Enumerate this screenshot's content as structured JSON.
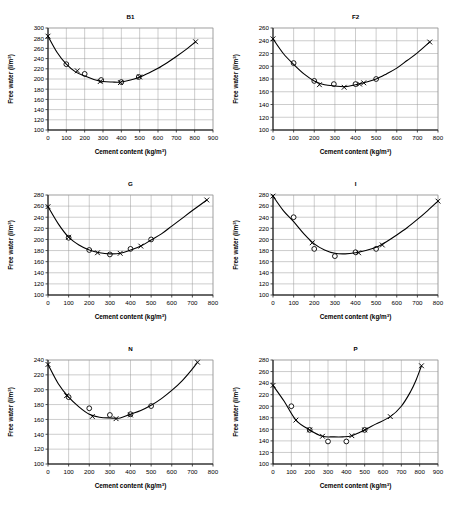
{
  "figure": {
    "background_color": "#ffffff",
    "line_color": "#000000",
    "grid_color": "#9a9a9a",
    "axis_label_x": "Cement content (kg/m",
    "axis_label_x_sup": "3",
    "axis_label_x_tail": ")",
    "axis_label_y": "Free water (l/m",
    "axis_label_y_sup": "3",
    "axis_label_y_tail": ")",
    "marker_legend": [
      "circle",
      "cross"
    ]
  },
  "chart_data": [
    {
      "type": "line",
      "title": "B1",
      "xlabel": "Cement content (kg/m3)",
      "ylabel": "Free water (l/m3)",
      "xlim": [
        0,
        900
      ],
      "ylim": [
        100,
        300
      ],
      "xticks": [
        0,
        100,
        200,
        300,
        400,
        500,
        600,
        700,
        800,
        900
      ],
      "yticks": [
        100,
        120,
        140,
        160,
        180,
        200,
        220,
        240,
        260,
        280,
        300
      ],
      "grid": true,
      "legend": "none",
      "series": [
        {
          "name": "measured-circle",
          "marker": "circle",
          "points": [
            [
              100,
              229
            ],
            [
              200,
              210
            ],
            [
              290,
              198
            ],
            [
              400,
              194
            ],
            [
              495,
              204
            ]
          ]
        },
        {
          "name": "predicted-cross",
          "marker": "cross",
          "points": [
            [
              0,
              284
            ],
            [
              160,
              216
            ],
            [
              285,
              195
            ],
            [
              395,
              193
            ],
            [
              500,
              204
            ],
            [
              805,
              273
            ]
          ]
        },
        {
          "name": "fitted-curve",
          "marker": "none",
          "points": [
            [
              0,
              284
            ],
            [
              50,
              252
            ],
            [
              100,
              229
            ],
            [
              150,
              214
            ],
            [
              200,
              206
            ],
            [
              250,
              199
            ],
            [
              300,
              195
            ],
            [
              350,
              194
            ],
            [
              400,
              194
            ],
            [
              450,
              198
            ],
            [
              500,
              204
            ],
            [
              550,
              212
            ],
            [
              600,
              221
            ],
            [
              650,
              232
            ],
            [
              700,
              244
            ],
            [
              750,
              257
            ],
            [
              805,
              273
            ]
          ]
        }
      ]
    },
    {
      "type": "line",
      "title": "F2",
      "xlabel": "Cement content (kg/m3)",
      "ylabel": "Free water (l/m3)",
      "xlim": [
        0,
        800
      ],
      "ylim": [
        100,
        260
      ],
      "xticks": [
        0,
        100,
        200,
        300,
        400,
        500,
        600,
        700,
        800
      ],
      "yticks": [
        100,
        120,
        140,
        160,
        180,
        200,
        220,
        240,
        260
      ],
      "grid": true,
      "legend": "none",
      "series": [
        {
          "name": "measured-circle",
          "marker": "circle",
          "points": [
            [
              100,
              205
            ],
            [
              200,
              177
            ],
            [
              295,
              172
            ],
            [
              400,
              172
            ],
            [
              500,
              180
            ]
          ]
        },
        {
          "name": "predicted-cross",
          "marker": "cross",
          "points": [
            [
              0,
              243
            ],
            [
              225,
              171
            ],
            [
              345,
              167
            ],
            [
              420,
              172
            ],
            [
              440,
              174
            ],
            [
              760,
              238
            ]
          ]
        },
        {
          "name": "fitted-curve",
          "marker": "none",
          "points": [
            [
              0,
              243
            ],
            [
              50,
              220
            ],
            [
              100,
              203
            ],
            [
              150,
              188
            ],
            [
              200,
              177
            ],
            [
              250,
              171
            ],
            [
              300,
              169
            ],
            [
              350,
              168
            ],
            [
              400,
              171
            ],
            [
              450,
              175
            ],
            [
              500,
              180
            ],
            [
              550,
              188
            ],
            [
              600,
              197
            ],
            [
              650,
              209
            ],
            [
              700,
              221
            ],
            [
              760,
              238
            ]
          ]
        }
      ]
    },
    {
      "type": "line",
      "title": "G",
      "xlabel": "Cement content (kg/m3)",
      "ylabel": "Free water (l/m3)",
      "xlim": [
        0,
        800
      ],
      "ylim": [
        100,
        280
      ],
      "xticks": [
        0,
        100,
        200,
        300,
        400,
        500,
        600,
        700,
        800
      ],
      "yticks": [
        100,
        120,
        140,
        160,
        180,
        200,
        220,
        240,
        260,
        280
      ],
      "grid": true,
      "legend": "none",
      "series": [
        {
          "name": "measured-circle",
          "marker": "circle",
          "points": [
            [
              100,
              203
            ],
            [
              200,
              181
            ],
            [
              300,
              173
            ],
            [
              400,
              183
            ],
            [
              500,
              200
            ]
          ]
        },
        {
          "name": "predicted-cross",
          "marker": "cross",
          "points": [
            [
              0,
              259
            ],
            [
              100,
              204
            ],
            [
              240,
              176
            ],
            [
              350,
              175
            ],
            [
              450,
              188
            ],
            [
              770,
              271
            ]
          ]
        },
        {
          "name": "fitted-curve",
          "marker": "none",
          "points": [
            [
              0,
              259
            ],
            [
              50,
              228
            ],
            [
              100,
              204
            ],
            [
              150,
              190
            ],
            [
              200,
              181
            ],
            [
              250,
              176
            ],
            [
              300,
              174
            ],
            [
              350,
              175
            ],
            [
              400,
              181
            ],
            [
              450,
              188
            ],
            [
              500,
              199
            ],
            [
              550,
              210
            ],
            [
              600,
              224
            ],
            [
              650,
              238
            ],
            [
              700,
              252
            ],
            [
              770,
              271
            ]
          ]
        }
      ]
    },
    {
      "type": "line",
      "title": "I",
      "xlabel": "Cement content (kg/m3)",
      "ylabel": "Free water (l/m3)",
      "xlim": [
        0,
        800
      ],
      "ylim": [
        100,
        280
      ],
      "xticks": [
        0,
        100,
        200,
        300,
        400,
        500,
        600,
        700,
        800
      ],
      "yticks": [
        100,
        120,
        140,
        160,
        180,
        200,
        220,
        240,
        260,
        280
      ],
      "grid": true,
      "legend": "none",
      "series": [
        {
          "name": "measured-circle",
          "marker": "circle",
          "points": [
            [
              100,
              240
            ],
            [
              200,
              183
            ],
            [
              300,
              170
            ],
            [
              400,
              177
            ],
            [
              500,
              183
            ]
          ]
        },
        {
          "name": "predicted-cross",
          "marker": "cross",
          "points": [
            [
              0,
              278
            ],
            [
              190,
              194
            ],
            [
              415,
              176
            ],
            [
              530,
              190
            ],
            [
              800,
              269
            ]
          ]
        },
        {
          "name": "fitted-curve",
          "marker": "none",
          "points": [
            [
              0,
              278
            ],
            [
              50,
              252
            ],
            [
              100,
              232
            ],
            [
              150,
              210
            ],
            [
              200,
              192
            ],
            [
              250,
              181
            ],
            [
              300,
              175
            ],
            [
              350,
              174
            ],
            [
              400,
              176
            ],
            [
              450,
              180
            ],
            [
              500,
              186
            ],
            [
              550,
              196
            ],
            [
              600,
              208
            ],
            [
              650,
              221
            ],
            [
              700,
              236
            ],
            [
              750,
              252
            ],
            [
              800,
              269
            ]
          ]
        }
      ]
    },
    {
      "type": "line",
      "title": "N",
      "xlabel": "Cement content (kg/m3)",
      "ylabel": "Free water (l/m3)",
      "xlim": [
        0,
        800
      ],
      "ylim": [
        100,
        240
      ],
      "xticks": [
        0,
        100,
        200,
        300,
        400,
        500,
        600,
        700,
        800
      ],
      "yticks": [
        100,
        120,
        140,
        160,
        180,
        200,
        220,
        240
      ],
      "grid": true,
      "legend": "none",
      "series": [
        {
          "name": "measured-circle",
          "marker": "circle",
          "points": [
            [
              100,
              190
            ],
            [
              200,
              175
            ],
            [
              300,
              166
            ],
            [
              400,
              167
            ],
            [
              500,
              178
            ]
          ]
        },
        {
          "name": "predicted-cross",
          "marker": "cross",
          "points": [
            [
              0,
              234
            ],
            [
              90,
              192
            ],
            [
              215,
              164
            ],
            [
              330,
              161
            ],
            [
              400,
              166
            ],
            [
              725,
              237
            ]
          ]
        },
        {
          "name": "fitted-curve",
          "marker": "none",
          "points": [
            [
              0,
              234
            ],
            [
              50,
              208
            ],
            [
              100,
              190
            ],
            [
              150,
              177
            ],
            [
              200,
              167
            ],
            [
              250,
              163
            ],
            [
              300,
              162
            ],
            [
              350,
              162
            ],
            [
              400,
              167
            ],
            [
              450,
              172
            ],
            [
              500,
              179
            ],
            [
              550,
              188
            ],
            [
              600,
              199
            ],
            [
              650,
              212
            ],
            [
              700,
              228
            ],
            [
              725,
              237
            ]
          ]
        }
      ]
    },
    {
      "type": "line",
      "title": "P",
      "xlabel": "Cement content (kg/m3)",
      "ylabel": "Free water (l/m3)",
      "xlim": [
        0,
        900
      ],
      "ylim": [
        100,
        280
      ],
      "xticks": [
        0,
        100,
        200,
        300,
        400,
        500,
        600,
        700,
        800,
        900
      ],
      "yticks": [
        100,
        120,
        140,
        160,
        180,
        200,
        220,
        240,
        260,
        280
      ],
      "grid": true,
      "legend": "none",
      "series": [
        {
          "name": "measured-circle",
          "marker": "circle",
          "points": [
            [
              100,
              200
            ],
            [
              200,
              159
            ],
            [
              300,
              139
            ],
            [
              400,
              139
            ],
            [
              500,
              159
            ]
          ]
        },
        {
          "name": "predicted-cross",
          "marker": "cross",
          "points": [
            [
              0,
              236
            ],
            [
              125,
              176
            ],
            [
              200,
              159
            ],
            [
              270,
              148
            ],
            [
              430,
              149
            ],
            [
              500,
              159
            ],
            [
              640,
              182
            ],
            [
              810,
              270
            ]
          ]
        },
        {
          "name": "fitted-curve",
          "marker": "none",
          "points": [
            [
              0,
              236
            ],
            [
              60,
              209
            ],
            [
              125,
              176
            ],
            [
              200,
              159
            ],
            [
              270,
              148
            ],
            [
              330,
              147
            ],
            [
              380,
              147
            ],
            [
              430,
              149
            ],
            [
              500,
              159
            ],
            [
              560,
              169
            ],
            [
              640,
              182
            ],
            [
              700,
              200
            ],
            [
              750,
              225
            ],
            [
              780,
              245
            ],
            [
              810,
              270
            ]
          ]
        }
      ]
    }
  ]
}
